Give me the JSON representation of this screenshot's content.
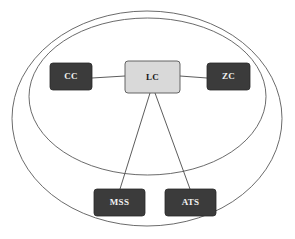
{
  "diagram": {
    "background_color": "#ffffff",
    "line_color": "#4a4a4a",
    "boundary_color": "#5a5a5a",
    "dark_node_fill": "#3b3b3b",
    "dark_node_text_color": "#f2f2f2",
    "light_node_fill": "#d9d9d9",
    "light_node_text_color": "#1a1a1a",
    "boundaries": [
      {
        "name": "outer-boundary",
        "cx": 147,
        "cy": 118.5,
        "rx": 135,
        "ry": 107.5
      },
      {
        "name": "inner-boundary",
        "cx": 147.5,
        "cy": 96.5,
        "rx": 118.5,
        "ry": 78.5
      }
    ],
    "nodes": [
      {
        "id": "cc",
        "label": "CC",
        "style": "dark",
        "x": 50,
        "y": 63,
        "w": 42,
        "h": 27
      },
      {
        "id": "lc",
        "label": "LC",
        "style": "light",
        "x": 125,
        "y": 61,
        "w": 55,
        "h": 32
      },
      {
        "id": "zc",
        "label": "ZC",
        "style": "dark",
        "x": 207,
        "y": 63,
        "w": 43,
        "h": 27
      },
      {
        "id": "mss",
        "label": "MSS",
        "style": "dark",
        "x": 94,
        "y": 189,
        "w": 51,
        "h": 27
      },
      {
        "id": "ats",
        "label": "ATS",
        "style": "dark",
        "x": 165,
        "y": 189,
        "w": 51,
        "h": 27
      }
    ],
    "links": [
      {
        "id": "cc-lc",
        "from": "cc",
        "to": "lc",
        "x1": 92,
        "y1": 78,
        "x2": 125,
        "y2": 76
      },
      {
        "id": "lc-zc",
        "from": "lc",
        "to": "zc",
        "x1": 180,
        "y1": 76,
        "x2": 207,
        "y2": 78
      },
      {
        "id": "lc-mss",
        "from": "lc",
        "to": "mss",
        "x1": 150,
        "y1": 93,
        "x2": 120,
        "y2": 189
      },
      {
        "id": "lc-ats",
        "from": "lc",
        "to": "ats",
        "x1": 155,
        "y1": 93,
        "x2": 190,
        "y2": 189
      }
    ],
    "label_font_size": 9
  }
}
